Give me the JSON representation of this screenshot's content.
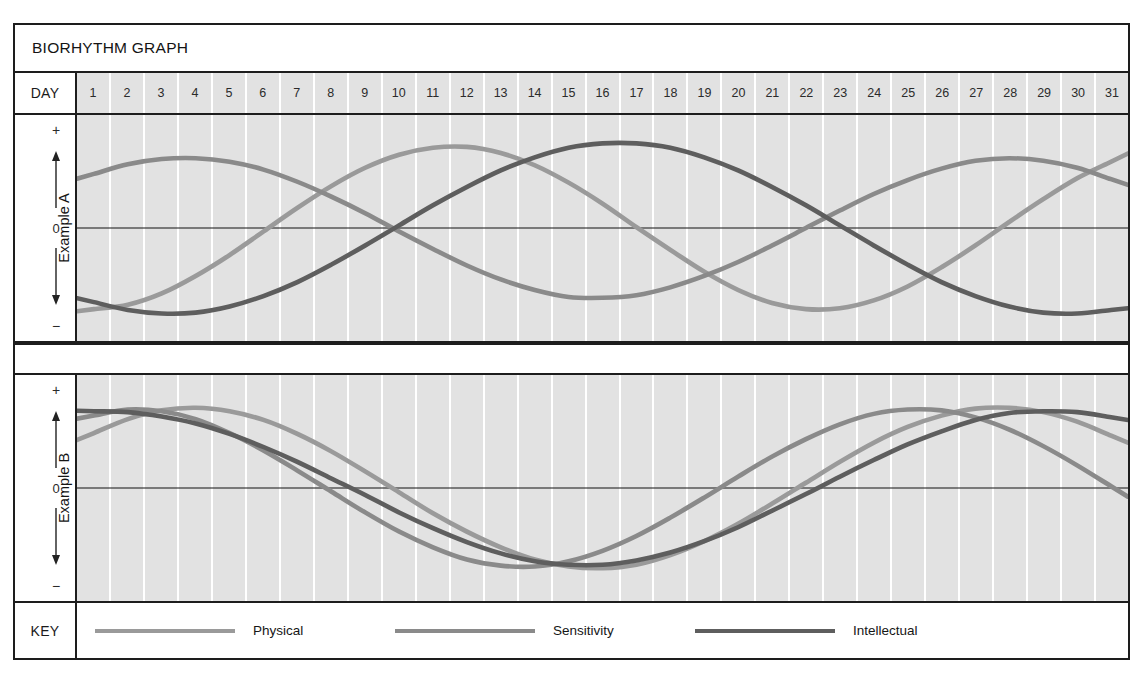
{
  "title": "BIORHYTHM GRAPH",
  "day_header": {
    "label": "DAY",
    "days": [
      1,
      2,
      3,
      4,
      5,
      6,
      7,
      8,
      9,
      10,
      11,
      12,
      13,
      14,
      15,
      16,
      17,
      18,
      19,
      20,
      21,
      22,
      23,
      24,
      25,
      26,
      27,
      28,
      29,
      30,
      31
    ]
  },
  "axis": {
    "positive": "+",
    "zero": "0",
    "negative": "−",
    "up_arrow_icon": "arrow-up-icon",
    "down_arrow_icon": "arrow-down-icon"
  },
  "panels": [
    {
      "id": "A",
      "label": "Example A"
    },
    {
      "id": "B",
      "label": "Example B"
    }
  ],
  "key": {
    "label": "KEY",
    "entries": [
      {
        "name": "Physical",
        "color": "#9a9a9a"
      },
      {
        "name": "Sensitivity",
        "color": "#8a8a8a"
      },
      {
        "name": "Intellectual",
        "color": "#5e5e5e"
      }
    ]
  },
  "colors": {
    "physical": "#9a9a9a",
    "sensitivity": "#8a8a8a",
    "intellectual": "#5e5e5e",
    "plot_background": "#e2e2e2",
    "gridline": "#ffffff",
    "frame": "#1d1d1d",
    "zero_line": "#111111"
  },
  "chart_data": {
    "type": "line",
    "title": "BIORHYTHM GRAPH",
    "xlabel": "DAY",
    "ylabel": "",
    "x": [
      1,
      2,
      3,
      4,
      5,
      6,
      7,
      8,
      9,
      10,
      11,
      12,
      13,
      14,
      15,
      16,
      17,
      18,
      19,
      20,
      21,
      22,
      23,
      24,
      25,
      26,
      27,
      28,
      29,
      30,
      31
    ],
    "xlim": [
      1,
      31
    ],
    "ylim": [
      -1,
      1
    ],
    "yticks": [
      "+",
      "0",
      "−"
    ],
    "grid": true,
    "legend_position": "bottom",
    "panels": [
      {
        "name": "Example A",
        "series": [
          {
            "name": "Physical",
            "color": "#9a9a9a",
            "period_days": 23,
            "phase_peak_day": 13,
            "amplitude": 0.93,
            "values": [
              -0.93,
              -0.88,
              -0.75,
              -0.55,
              -0.31,
              -0.04,
              0.23,
              0.48,
              0.69,
              0.84,
              0.92,
              0.93,
              0.86,
              0.72,
              0.52,
              0.28,
              0.01,
              -0.25,
              -0.5,
              -0.71,
              -0.86,
              -0.93,
              -0.92,
              -0.83,
              -0.67,
              -0.45,
              -0.2,
              0.07,
              0.33,
              0.57,
              0.76
            ]
          },
          {
            "name": "Sensitivity",
            "color": "#8a8a8a",
            "period_days": 28,
            "phase_peak_day": 4,
            "amplitude": 0.8,
            "values": [
              0.62,
              0.73,
              0.79,
              0.8,
              0.76,
              0.67,
              0.53,
              0.36,
              0.17,
              -0.04,
              -0.24,
              -0.43,
              -0.59,
              -0.71,
              -0.79,
              -0.8,
              -0.77,
              -0.68,
              -0.55,
              -0.39,
              -0.2,
              0.0,
              0.2,
              0.39,
              0.55,
              0.68,
              0.77,
              0.8,
              0.77,
              0.69,
              0.56
            ]
          },
          {
            "name": "Intellectual",
            "color": "#5e5e5e",
            "period_days": 33,
            "phase_peak_day": 21,
            "amplitude": 0.97,
            "values": [
              -0.85,
              -0.94,
              -0.98,
              -0.97,
              -0.9,
              -0.78,
              -0.62,
              -0.42,
              -0.2,
              0.03,
              0.26,
              0.47,
              0.66,
              0.81,
              0.92,
              0.97,
              0.97,
              0.92,
              0.81,
              0.66,
              0.47,
              0.26,
              0.03,
              -0.2,
              -0.42,
              -0.62,
              -0.78,
              -0.9,
              -0.97,
              -0.98,
              -0.94
            ]
          }
        ]
      },
      {
        "name": "Example B",
        "series": [
          {
            "name": "Physical",
            "color": "#9a9a9a",
            "period_days": 23,
            "phase_peak_day": 4,
            "amplitude": 0.92,
            "values": [
              0.63,
              0.79,
              0.89,
              0.92,
              0.88,
              0.78,
              0.62,
              0.42,
              0.19,
              -0.05,
              -0.29,
              -0.5,
              -0.68,
              -0.82,
              -0.9,
              -0.92,
              -0.88,
              -0.77,
              -0.61,
              -0.41,
              -0.18,
              0.06,
              0.3,
              0.52,
              0.7,
              0.83,
              0.91,
              0.92,
              0.87,
              0.76,
              0.6
            ]
          },
          {
            "name": "Sensitivity",
            "color": "#8a8a8a",
            "period_days": 28,
            "phase_peak_day": 2,
            "amplitude": 0.9,
            "values": [
              0.83,
              0.9,
              0.88,
              0.79,
              0.63,
              0.43,
              0.2,
              -0.04,
              -0.28,
              -0.5,
              -0.68,
              -0.82,
              -0.89,
              -0.9,
              -0.84,
              -0.72,
              -0.55,
              -0.34,
              -0.11,
              0.13,
              0.36,
              0.56,
              0.73,
              0.85,
              0.9,
              0.89,
              0.81,
              0.67,
              0.48,
              0.26,
              0.02
            ]
          },
          {
            "name": "Intellectual",
            "color": "#5e5e5e",
            "period_days": 33,
            "phase_peak_day": 1,
            "amplitude": 0.88,
            "values": [
              0.88,
              0.87,
              0.82,
              0.74,
              0.62,
              0.47,
              0.3,
              0.11,
              -0.08,
              -0.28,
              -0.46,
              -0.62,
              -0.75,
              -0.84,
              -0.88,
              -0.88,
              -0.83,
              -0.74,
              -0.61,
              -0.45,
              -0.26,
              -0.07,
              0.13,
              0.32,
              0.5,
              0.65,
              0.78,
              0.86,
              0.88,
              0.87,
              0.81
            ]
          }
        ]
      }
    ]
  }
}
